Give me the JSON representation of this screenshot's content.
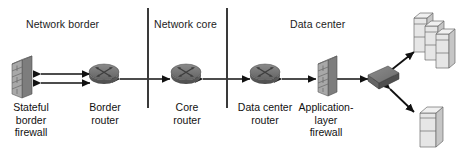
{
  "diagram": {
    "type": "network-topology",
    "width": 468,
    "height": 157,
    "background": "#ffffff",
    "colors": {
      "stroke": "#1a1a1a",
      "text": "#111111",
      "divider": "#3a3a3a",
      "router_top": "#6e6e6e",
      "router_body": "#585858",
      "firewall_face": "#9a9a9a",
      "firewall_side": "#6f6f6f",
      "switch_top": "#7a7a7a",
      "switch_side": "#5e5e5e",
      "server_face": "#e4e4e4",
      "server_side": "#c2c2c2",
      "server_line": "#6a6a6a"
    }
  },
  "zones": [
    {
      "id": "network-border",
      "label": "Network border",
      "x": 26,
      "y": 18
    },
    {
      "id": "network-core",
      "label": "Network core",
      "x": 154,
      "y": 18
    },
    {
      "id": "data-center",
      "label": "Data center",
      "x": 290,
      "y": 18
    }
  ],
  "dividers": [
    {
      "id": "border-core-divider",
      "x": 147,
      "y": 8,
      "height": 100
    },
    {
      "id": "core-datacenter-divider",
      "x": 226,
      "y": 8,
      "height": 100
    }
  ],
  "nodes": [
    {
      "id": "stateful-border-firewall",
      "icon": "firewall-icon",
      "label": "Stateful\nborder\nfirewall",
      "label_lines": [
        "Stateful",
        "border",
        "firewall"
      ],
      "x": 30,
      "y": 78,
      "label_x": 30,
      "label_y": 103
    },
    {
      "id": "border-router",
      "icon": "router-icon",
      "label": "Border\nrouter",
      "label_lines": [
        "Border",
        "router"
      ],
      "x": 104,
      "y": 78,
      "label_x": 104,
      "label_y": 103
    },
    {
      "id": "core-router",
      "icon": "router-icon",
      "label": "Core\nrouter",
      "label_lines": [
        "Core",
        "router"
      ],
      "x": 186,
      "y": 78,
      "label_x": 186,
      "label_y": 103
    },
    {
      "id": "data-center-router",
      "icon": "router-icon",
      "label": "Data center\nrouter",
      "label_lines": [
        "Data center",
        "router"
      ],
      "x": 265,
      "y": 78,
      "label_x": 265,
      "label_y": 103
    },
    {
      "id": "application-layer-firewall",
      "icon": "firewall-icon",
      "label": "Application-\nlayer\nfirewall",
      "label_lines": [
        "Application-",
        "layer",
        "firewall"
      ],
      "x": 326,
      "y": 78,
      "label_x": 326,
      "label_y": 103
    },
    {
      "id": "switch",
      "icon": "switch-icon",
      "label": "",
      "label_lines": [],
      "x": 383,
      "y": 79,
      "label_x": 383,
      "label_y": 0
    },
    {
      "id": "server-group",
      "icon": "server-stack-icon",
      "label": "",
      "label_lines": [],
      "x": 432,
      "y": 32,
      "label_x": 0,
      "label_y": 0
    },
    {
      "id": "server-single",
      "icon": "server-icon",
      "label": "",
      "label_lines": [],
      "x": 430,
      "y": 127,
      "label_x": 0,
      "label_y": 0
    }
  ],
  "links": [
    {
      "id": "firewall-to-border-router-upper",
      "from": "stateful-border-firewall",
      "to": "border-router",
      "arrows": "both"
    },
    {
      "id": "firewall-to-border-router-lower",
      "from": "stateful-border-firewall",
      "to": "border-router",
      "arrows": "both"
    },
    {
      "id": "border-router-to-core-router",
      "from": "border-router",
      "to": "core-router",
      "arrows": "both"
    },
    {
      "id": "core-router-to-data-center-router",
      "from": "core-router",
      "to": "data-center-router",
      "arrows": "both"
    },
    {
      "id": "data-center-router-to-app-firewall",
      "from": "data-center-router",
      "to": "application-layer-firewall",
      "arrows": "both"
    },
    {
      "id": "app-firewall-to-switch",
      "from": "application-layer-firewall",
      "to": "switch",
      "arrows": "both"
    },
    {
      "id": "switch-to-server-group",
      "from": "switch",
      "to": "server-group",
      "arrows": "both"
    },
    {
      "id": "switch-to-server-single",
      "from": "switch",
      "to": "server-single",
      "arrows": "both"
    }
  ]
}
